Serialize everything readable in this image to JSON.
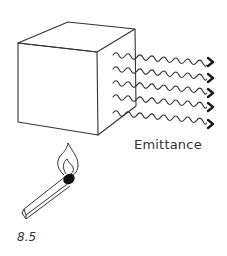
{
  "figure": {
    "label": "Emittance",
    "number": "8.5"
  },
  "colors": {
    "background": "#ffffff",
    "stroke": "#333333",
    "arrowhead": "#1a1a1a",
    "match_head": "#111111"
  },
  "elements": {
    "cube": "hand-drawn cube",
    "waves": {
      "count": 5,
      "direction": "right"
    },
    "match": "lit match with flame beneath cube"
  }
}
